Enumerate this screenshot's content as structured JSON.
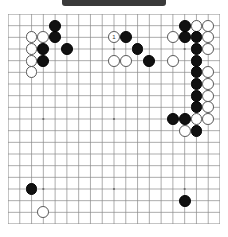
{
  "diagram": {
    "type": "go-board",
    "size": 19,
    "title_bar_color": "#3a3a3a",
    "line_color": "#8a8a8a",
    "board_color": "#ffffff",
    "black_color": "#111111",
    "white_color": "#ffffff",
    "caption": "",
    "columns": 19,
    "rows": 19,
    "star_points": [
      [
        3,
        3
      ],
      [
        9,
        3
      ],
      [
        15,
        3
      ],
      [
        3,
        9
      ],
      [
        9,
        9
      ],
      [
        15,
        9
      ],
      [
        3,
        15
      ],
      [
        9,
        15
      ],
      [
        15,
        15
      ]
    ],
    "stones": [
      {
        "col": 4,
        "row": 1,
        "color": "black",
        "label": ""
      },
      {
        "col": 2,
        "row": 2,
        "color": "white",
        "label": ""
      },
      {
        "col": 3,
        "row": 2,
        "color": "white",
        "label": ""
      },
      {
        "col": 4,
        "row": 2,
        "color": "black",
        "label": ""
      },
      {
        "col": 2,
        "row": 3,
        "color": "white",
        "label": ""
      },
      {
        "col": 3,
        "row": 3,
        "color": "black",
        "label": ""
      },
      {
        "col": 5,
        "row": 3,
        "color": "black",
        "label": ""
      },
      {
        "col": 2,
        "row": 4,
        "color": "white",
        "label": ""
      },
      {
        "col": 3,
        "row": 4,
        "color": "black",
        "label": ""
      },
      {
        "col": 2,
        "row": 5,
        "color": "white",
        "label": ""
      },
      {
        "col": 9,
        "row": 2,
        "color": "white",
        "label": "1"
      },
      {
        "col": 10,
        "row": 2,
        "color": "black",
        "label": ""
      },
      {
        "col": 11,
        "row": 3,
        "color": "black",
        "label": ""
      },
      {
        "col": 9,
        "row": 4,
        "color": "white",
        "label": ""
      },
      {
        "col": 10,
        "row": 4,
        "color": "white",
        "label": ""
      },
      {
        "col": 12,
        "row": 4,
        "color": "black",
        "label": ""
      },
      {
        "col": 15,
        "row": 1,
        "color": "black",
        "label": ""
      },
      {
        "col": 16,
        "row": 1,
        "color": "white",
        "label": ""
      },
      {
        "col": 17,
        "row": 1,
        "color": "white",
        "label": ""
      },
      {
        "col": 14,
        "row": 2,
        "color": "white",
        "label": ""
      },
      {
        "col": 15,
        "row": 2,
        "color": "black",
        "label": ""
      },
      {
        "col": 16,
        "row": 2,
        "color": "black",
        "label": ""
      },
      {
        "col": 17,
        "row": 2,
        "color": "white",
        "label": ""
      },
      {
        "col": 16,
        "row": 3,
        "color": "black",
        "label": ""
      },
      {
        "col": 17,
        "row": 3,
        "color": "white",
        "label": ""
      },
      {
        "col": 14,
        "row": 4,
        "color": "white",
        "label": ""
      },
      {
        "col": 16,
        "row": 4,
        "color": "black",
        "label": ""
      },
      {
        "col": 16,
        "row": 5,
        "color": "black",
        "label": ""
      },
      {
        "col": 17,
        "row": 5,
        "color": "white",
        "label": ""
      },
      {
        "col": 16,
        "row": 6,
        "color": "black",
        "label": ""
      },
      {
        "col": 17,
        "row": 6,
        "color": "white",
        "label": ""
      },
      {
        "col": 16,
        "row": 7,
        "color": "black",
        "label": ""
      },
      {
        "col": 17,
        "row": 7,
        "color": "white",
        "label": ""
      },
      {
        "col": 16,
        "row": 8,
        "color": "black",
        "label": ""
      },
      {
        "col": 17,
        "row": 8,
        "color": "white",
        "label": ""
      },
      {
        "col": 14,
        "row": 9,
        "color": "black",
        "label": ""
      },
      {
        "col": 15,
        "row": 9,
        "color": "black",
        "label": ""
      },
      {
        "col": 16,
        "row": 9,
        "color": "white",
        "label": ""
      },
      {
        "col": 17,
        "row": 9,
        "color": "white",
        "label": ""
      },
      {
        "col": 15,
        "row": 10,
        "color": "white",
        "label": ""
      },
      {
        "col": 16,
        "row": 10,
        "color": "black",
        "label": ""
      },
      {
        "col": 2,
        "row": 15,
        "color": "black",
        "label": ""
      },
      {
        "col": 3,
        "row": 17,
        "color": "white",
        "label": ""
      },
      {
        "col": 15,
        "row": 16,
        "color": "black",
        "label": ""
      }
    ]
  }
}
